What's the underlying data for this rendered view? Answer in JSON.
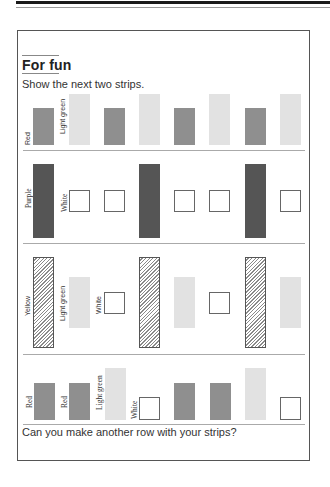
{
  "section": {
    "title": "For fun",
    "instruction": "Show the next two strips.",
    "question": "Can you make another row with your strips?"
  },
  "colors": {
    "Red": "#8f8f8f",
    "Light green": "#e2e2e2",
    "Purple": "#555555",
    "White": "#ffffff",
    "Yellow": "hatched"
  },
  "rows": [
    {
      "labels": [
        "Red",
        "Light green"
      ],
      "strips": [
        "Red",
        "Light green",
        "Red",
        "Light green",
        "Red",
        "Light green",
        "Red",
        "Light green"
      ]
    },
    {
      "labels": [
        "Purple",
        "White"
      ],
      "strips": [
        "Purple",
        "White",
        "White",
        "Purple",
        "White",
        "White",
        "Purple",
        "White"
      ]
    },
    {
      "labels": [
        "Yellow",
        "Light green",
        "White"
      ],
      "strips": [
        "Yellow",
        "Light green",
        "White",
        "Yellow",
        "Light green",
        "White",
        "Yellow",
        "Light green"
      ]
    },
    {
      "labels": [
        "Red",
        "Red",
        "Light green",
        "White"
      ],
      "strips": [
        "Red",
        "Red",
        "Light green",
        "White",
        "Red",
        "Red",
        "Light green",
        "White"
      ]
    }
  ]
}
